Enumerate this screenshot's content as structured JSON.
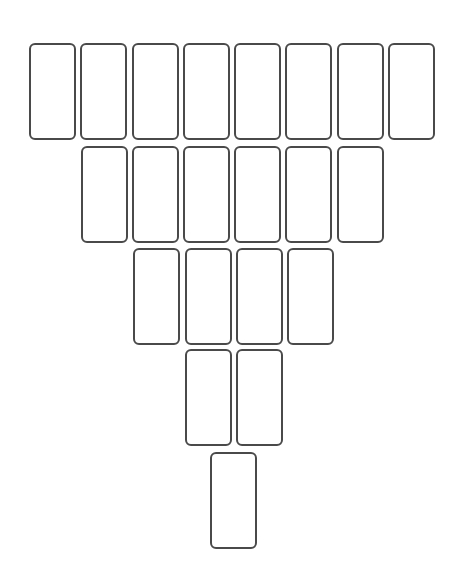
{
  "diagram": {
    "type": "card-layout",
    "shape": "inverted-triangle",
    "row_counts": [
      8,
      6,
      4,
      2,
      1
    ],
    "total_cards": 21,
    "card_style": {
      "width": 47,
      "height": 97,
      "border_color": "#4a4a4a",
      "fill_color": "#ffffff",
      "corner_radius": 6
    },
    "rows": [
      {
        "top": 43,
        "lefts": [
          29,
          80,
          132,
          183,
          234,
          285,
          337,
          388
        ]
      },
      {
        "top": 146,
        "lefts": [
          81,
          132,
          183,
          234,
          285,
          337
        ]
      },
      {
        "top": 248,
        "lefts": [
          133,
          185,
          236,
          287
        ]
      },
      {
        "top": 349,
        "lefts": [
          185,
          236
        ]
      },
      {
        "top": 452,
        "lefts": [
          210
        ]
      }
    ]
  }
}
